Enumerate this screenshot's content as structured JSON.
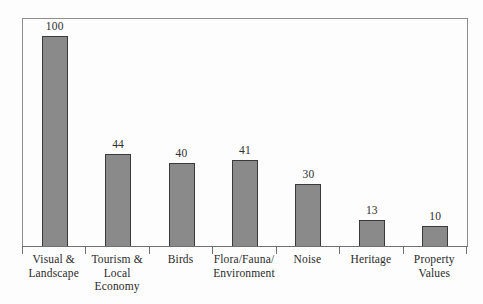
{
  "figure": {
    "background_color": "#fdfdfd",
    "frame_color": "#8d8d8d",
    "axis_color": "#6f6f6f"
  },
  "chart_data": {
    "type": "bar",
    "title": "",
    "subtitle": "",
    "xlabel": "",
    "ylabel": "",
    "ylim": [
      0,
      108
    ],
    "grid": false,
    "legend": false,
    "legend_position": "none",
    "bar_fill_color": "#8a8a8a",
    "bar_edge_color": "#3a3a3a",
    "value_labels_shown": true,
    "axis_tick_labels_shown": false,
    "categories": [
      "Visual &\nLandscape",
      "Tourism &\nLocal\nEconomy",
      "Birds",
      "Flora/Fauna/\nEnvironment",
      "Noise",
      "Heritage",
      "Property\nValues"
    ],
    "values": [
      100,
      44,
      40,
      41,
      30,
      13,
      10
    ],
    "value_labels": [
      "100",
      "44",
      "40",
      "41",
      "30",
      "13",
      "10"
    ]
  }
}
